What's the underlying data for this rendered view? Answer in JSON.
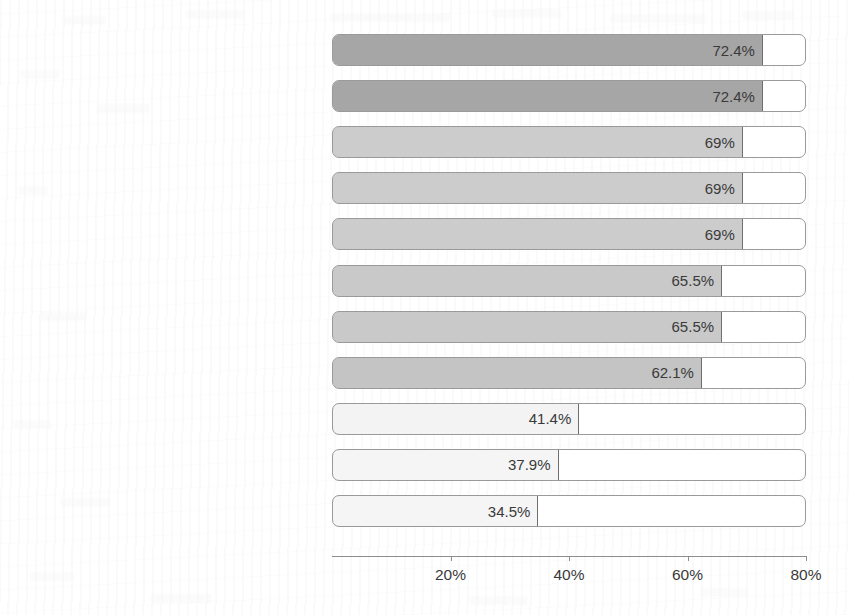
{
  "chart_data": {
    "type": "bar",
    "orientation": "horizontal",
    "title": "",
    "subtitle": "",
    "xlabel": "",
    "ylabel": "",
    "xlim": [
      0,
      80
    ],
    "xtick_labels": [
      "20%",
      "40%",
      "60%",
      "80%"
    ],
    "xtick_values": [
      20,
      40,
      60,
      80
    ],
    "grid": false,
    "legend": null,
    "value_suffix": "%",
    "categories": [
      "Exploratory ability",
      "Innovation ability",
      "Observation ability",
      "Ability to ask questions",
      "Practical ability",
      "Empathy",
      "Teamwork ability",
      "Communication and expression ability",
      "Social participation literacy",
      "The ability to change the world",
      "Self-confidence"
    ],
    "values": [
      72.4,
      72.4,
      69,
      69,
      69,
      65.5,
      65.5,
      62.1,
      41.4,
      37.9,
      34.5
    ],
    "value_labels": [
      "72.4%",
      "72.4%",
      "69%",
      "69%",
      "69%",
      "65.5%",
      "65.5%",
      "62.1%",
      "41.4%",
      "37.9%",
      "34.5%"
    ],
    "bar_colors": [
      "#a6a6a6",
      "#a6a6a6",
      "#cccccc",
      "#cccccc",
      "#cccccc",
      "#c9c9c9",
      "#c9c9c9",
      "#c4c4c4",
      "#f3f3f3",
      "#f5f5f5",
      "#f5f5f5"
    ],
    "track_color": "#ffffff",
    "track_border_color": "#9a9a9a",
    "bar_border_color": "#6f6f6f",
    "axis_color": "#8d8d8d",
    "text_color": "#3a3a3a"
  }
}
